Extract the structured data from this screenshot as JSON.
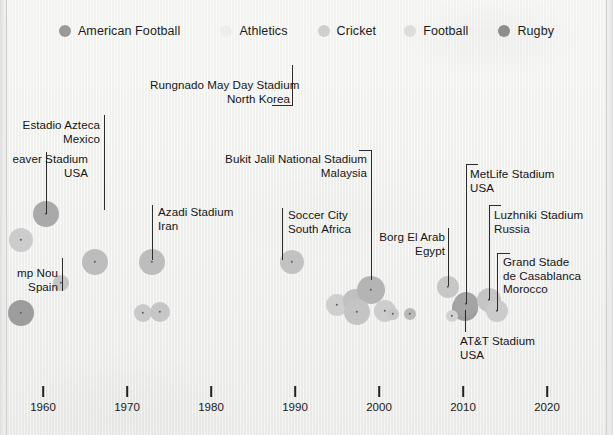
{
  "legend": {
    "items": [
      {
        "label": "American Football",
        "color": "#9a9a9a",
        "dot": "legend-dot-american-football"
      },
      {
        "label": "Athletics",
        "color": "#eeeeee",
        "dot": "legend-dot-athletics"
      },
      {
        "label": "Cricket",
        "color": "#cfcfcf",
        "dot": "legend-dot-cricket"
      },
      {
        "label": "Football",
        "color": "#dddddd",
        "dot": "legend-dot-football"
      },
      {
        "label": "Rugby",
        "color": "#8e8e8e",
        "dot": "legend-dot-rugby"
      }
    ]
  },
  "axis": {
    "ticks": [
      {
        "label": "1960",
        "x": 43
      },
      {
        "label": "1970",
        "x": 127
      },
      {
        "label": "1980",
        "x": 211
      },
      {
        "label": "1990",
        "x": 295
      },
      {
        "label": "2000",
        "x": 379
      },
      {
        "label": "2010",
        "x": 463
      },
      {
        "label": "2020",
        "x": 547
      }
    ]
  },
  "annotations": [
    {
      "name": "annot-rungnado",
      "text": "Rungnado May Day Stadium\nNorth Korea",
      "align": "right",
      "x": 150,
      "y": 78,
      "w": 140
    },
    {
      "name": "annot-azteca",
      "text": "Estadio Azteca\nMexico",
      "align": "right",
      "x": 10,
      "y": 118,
      "w": 90
    },
    {
      "name": "annot-beaver",
      "text": "eaver Stadium\nUSA",
      "align": "right",
      "x": -6,
      "y": 152,
      "w": 94
    },
    {
      "name": "annot-bukitjalil",
      "text": "Bukit Jalil National Stadium\nMalaysia",
      "align": "right",
      "x": 224,
      "y": 152,
      "w": 143
    },
    {
      "name": "annot-azadi",
      "text": "Azadi Stadium\nIran",
      "align": "left",
      "x": 158,
      "y": 205,
      "w": 110
    },
    {
      "name": "annot-soccercity",
      "text": "Soccer City\nSouth Africa",
      "align": "left",
      "x": 288,
      "y": 208,
      "w": 110
    },
    {
      "name": "annot-metlife",
      "text": "MetLife Stadium\nUSA",
      "align": "left",
      "x": 470,
      "y": 167,
      "w": 110
    },
    {
      "name": "annot-luzhniki",
      "text": "Luzhniki Stadium\nRussia",
      "align": "left",
      "x": 494,
      "y": 208,
      "w": 110
    },
    {
      "name": "annot-borgelarab",
      "text": "Borg El Arab\nEgypt",
      "align": "right",
      "x": 372,
      "y": 230,
      "w": 73
    },
    {
      "name": "annot-campnou",
      "text": "mp Nou\nSpain",
      "align": "right",
      "x": -10,
      "y": 266,
      "w": 68
    },
    {
      "name": "annot-casablanca",
      "text": "Grand Stade\nde Casablanca\nMorocco",
      "align": "left",
      "x": 503,
      "y": 255,
      "w": 110
    },
    {
      "name": "annot-attstadium",
      "text": "AT&T Stadium\nUSA",
      "align": "left",
      "x": 460,
      "y": 334,
      "w": 110
    }
  ],
  "leaders": [
    {
      "name": "leader-rungnado",
      "segments": [
        {
          "x": 292,
          "y": 65,
          "w": 1,
          "h": 40
        },
        {
          "x": 272,
          "y": 105,
          "w": 21,
          "h": 1
        }
      ]
    },
    {
      "name": "leader-azteca",
      "segments": [
        {
          "x": 104,
          "y": 115,
          "w": 1,
          "h": 95
        }
      ]
    },
    {
      "name": "leader-beaver",
      "segments": [
        {
          "x": 46,
          "y": 152,
          "w": 1,
          "h": 62
        }
      ]
    },
    {
      "name": "leader-bukitjalil",
      "segments": [
        {
          "x": 371,
          "y": 150,
          "w": 1,
          "h": 130
        },
        {
          "x": 359,
          "y": 150,
          "w": 13,
          "h": 1
        }
      ]
    },
    {
      "name": "leader-azadi",
      "segments": [
        {
          "x": 152,
          "y": 205,
          "w": 1,
          "h": 55
        }
      ]
    },
    {
      "name": "leader-soccercity",
      "segments": [
        {
          "x": 282,
          "y": 208,
          "w": 1,
          "h": 52
        }
      ]
    },
    {
      "name": "leader-metlife",
      "segments": [
        {
          "x": 466,
          "y": 164,
          "w": 1,
          "h": 140
        },
        {
          "x": 466,
          "y": 164,
          "w": 12,
          "h": 1
        }
      ]
    },
    {
      "name": "leader-luzhniki",
      "segments": [
        {
          "x": 489,
          "y": 205,
          "w": 1,
          "h": 95
        },
        {
          "x": 489,
          "y": 205,
          "w": 12,
          "h": 1
        }
      ]
    },
    {
      "name": "leader-borgelarab",
      "segments": [
        {
          "x": 448,
          "y": 228,
          "w": 1,
          "h": 58
        }
      ]
    },
    {
      "name": "leader-campnou",
      "segments": [
        {
          "x": 62,
          "y": 258,
          "w": 1,
          "h": 33
        }
      ]
    },
    {
      "name": "leader-casablanca",
      "segments": [
        {
          "x": 497,
          "y": 253,
          "w": 1,
          "h": 58
        },
        {
          "x": 497,
          "y": 253,
          "w": 13,
          "h": 1
        }
      ]
    },
    {
      "name": "leader-attstadium",
      "segments": [
        {
          "x": 465,
          "y": 310,
          "w": 1,
          "h": 22
        }
      ]
    }
  ],
  "chart_data": {
    "type": "scatter",
    "title": "",
    "xlabel": "",
    "ylabel": "",
    "xlim": [
      1955,
      2025
    ],
    "grid": false,
    "legend_position": "top-center",
    "series": [
      {
        "name": "American Football",
        "color": "#9a9a9a"
      },
      {
        "name": "Athletics",
        "color": "#eeeeee"
      },
      {
        "name": "Cricket",
        "color": "#cfcfcf"
      },
      {
        "name": "Football",
        "color": "#dddddd"
      },
      {
        "name": "Rugby",
        "color": "#8e8e8e"
      }
    ],
    "points": [
      {
        "name": "Camp Nou",
        "country": "Spain",
        "sport": "Football",
        "x": 21,
        "y": 240,
        "r": 12,
        "color": "#cccccc"
      },
      {
        "name": "Beaver Stadium",
        "country": "USA",
        "sport": "American Football",
        "x": 46,
        "y": 214,
        "r": 13,
        "color": "#a9a9a9"
      },
      {
        "name": "Estadio Azteca",
        "country": "Mexico",
        "sport": "Football",
        "x": 95,
        "y": 262,
        "r": 13,
        "color": "#bdbdbd"
      },
      {
        "name": "Melbourne Cricket Ground",
        "country": "Australia",
        "sport": "Cricket",
        "x": 21,
        "y": 313,
        "r": 13,
        "color": "#9d9d9d"
      },
      {
        "name": "Eden Gardens",
        "country": "India",
        "sport": "Cricket",
        "x": 61,
        "y": 283,
        "r": 8,
        "color": "#c5c5c5"
      },
      {
        "name": "Azadi Stadium",
        "country": "Iran",
        "sport": "Football",
        "x": 152,
        "y": 262,
        "r": 13,
        "color": "#bdbdbd"
      },
      {
        "name": "Bung Karno Stadium",
        "country": "Indonesia",
        "sport": "Football",
        "x": 143,
        "y": 313,
        "r": 9,
        "color": "#c9c9c9"
      },
      {
        "name": "Salt Lake Stadium",
        "country": "India",
        "sport": "Football",
        "x": 160,
        "y": 312,
        "r": 10,
        "color": "#c6c6c6"
      },
      {
        "name": "Rungnado May Day Stadium",
        "country": "North Korea",
        "sport": "Athletics",
        "x": 292,
        "y": 105,
        "r": 0,
        "color": "#eeeeee"
      },
      {
        "name": "Soccer City",
        "country": "South Africa",
        "sport": "Football",
        "x": 292,
        "y": 262,
        "r": 12,
        "color": "#c2c2c2"
      },
      {
        "name": "Wembley Stadium",
        "country": "England",
        "sport": "Football",
        "x": 337,
        "y": 305,
        "r": 11,
        "color": "#cfcfcf"
      },
      {
        "name": "Estadio Monumental",
        "country": "Peru",
        "sport": "Football",
        "x": 355,
        "y": 301,
        "r": 12,
        "color": "#c0c0c0"
      },
      {
        "name": "Bukit Jalil National Stadium",
        "country": "Malaysia",
        "sport": "Football",
        "x": 371,
        "y": 290,
        "r": 14,
        "color": "#b4b4b4"
      },
      {
        "name": "Borussia Park",
        "country": "Germany",
        "sport": "Football",
        "x": 357,
        "y": 312,
        "r": 13,
        "color": "#c4c4c4"
      },
      {
        "name": "Gelora Bung Tomo",
        "country": "Indonesia",
        "sport": "Football",
        "x": 385,
        "y": 311,
        "r": 11,
        "color": "#cdcdcd"
      },
      {
        "name": "Borg El Arab",
        "country": "Egypt",
        "sport": "Football",
        "x": 448,
        "y": 287,
        "r": 11,
        "color": "#c7c7c7"
      },
      {
        "name": "AT&T Stadium",
        "country": "USA",
        "sport": "American Football",
        "x": 465,
        "y": 308,
        "r": 13,
        "color": "#9e9e9e"
      },
      {
        "name": "MetLife Stadium",
        "country": "USA",
        "sport": "American Football",
        "x": 466,
        "y": 304,
        "r": 12,
        "color": "#a4a4a4"
      },
      {
        "name": "Estadio Azteca 2",
        "country": "Mexico",
        "sport": "Football",
        "x": 452,
        "y": 316,
        "r": 6,
        "color": "#d2d2d2"
      },
      {
        "name": "Luzhniki Stadium",
        "country": "Russia",
        "sport": "Football",
        "x": 489,
        "y": 300,
        "r": 12,
        "color": "#c5c5c5"
      },
      {
        "name": "Grand Stade de Casablanca",
        "country": "Morocco",
        "sport": "Football",
        "x": 497,
        "y": 311,
        "r": 11,
        "color": "#cbcbcb"
      },
      {
        "name": "Twickenham",
        "country": "England",
        "sport": "Rugby",
        "x": 410,
        "y": 314,
        "r": 6,
        "color": "#b9b9b9"
      },
      {
        "name": "Stade de France",
        "country": "France",
        "sport": "Football",
        "x": 393,
        "y": 314,
        "r": 6,
        "color": "#c8c8c8"
      }
    ]
  }
}
